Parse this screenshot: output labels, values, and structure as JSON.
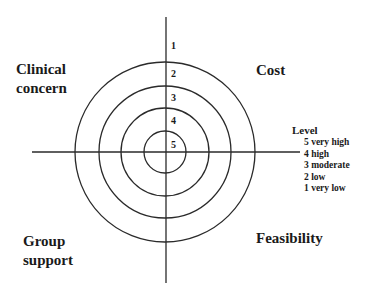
{
  "diagram": {
    "type": "concentric-target-quadrant",
    "quadrants": {
      "top_left": [
        "Clinical",
        "concern"
      ],
      "top_right": [
        "Cost"
      ],
      "bottom_left": [
        "Group",
        "support"
      ],
      "bottom_right": [
        "Feasibility"
      ]
    },
    "rings": [
      {
        "label": "1",
        "radius": 90
      },
      {
        "label": "2",
        "radius": 66
      },
      {
        "label": "3",
        "radius": 44
      },
      {
        "label": "4",
        "radius": 21
      },
      {
        "label": "5",
        "radius": 0
      }
    ],
    "legend": {
      "title": "Level",
      "items": [
        "5 very high",
        "4 high",
        "3 moderate",
        "2 low",
        "1 very low"
      ]
    },
    "colors": {
      "line": "#2a2a2a",
      "text": "#1a1a1a",
      "background": "#ffffff"
    }
  }
}
